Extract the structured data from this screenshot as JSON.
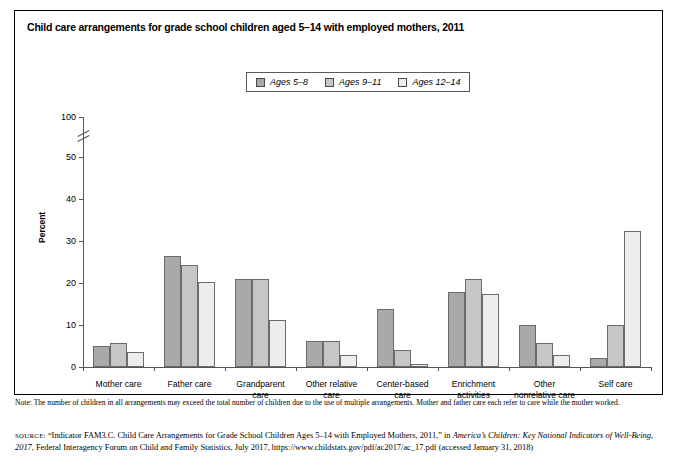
{
  "figure": {
    "title": "Child care arrangements for grade school children aged 5–14 with employed mothers, 2011"
  },
  "legend": {
    "items": [
      {
        "label": "Ages 5–8",
        "color": "#a9a9a9"
      },
      {
        "label": "Ages 9–11",
        "color": "#c6c6c6"
      },
      {
        "label": "Ages 12–14",
        "color": "#eeeeee"
      }
    ]
  },
  "chart_data": {
    "type": "bar",
    "title": "Child care arrangements for grade school children aged 5–14 with employed mothers, 2011",
    "xlabel": "",
    "ylabel": "Percent",
    "ylim": [
      0,
      100
    ],
    "yticks": [
      0,
      10,
      20,
      30,
      40,
      50,
      100
    ],
    "axis_break": "between 50 and 100",
    "grid": false,
    "legend_position": "top-center",
    "categories": [
      "Mother care",
      "Father care",
      "Grandparent care",
      "Other relative care",
      "Center-based care",
      "Enrichment activities",
      "Other nonrelative care",
      "Self care"
    ],
    "series": [
      {
        "name": "Ages 5–8",
        "color": "#a9a9a9",
        "values": [
          4.9,
          26.5,
          21.0,
          6.2,
          13.8,
          17.9,
          10.0,
          2.2
        ]
      },
      {
        "name": "Ages 9–11",
        "color": "#c6c6c6",
        "values": [
          5.6,
          24.3,
          21.0,
          6.2,
          4.0,
          21.0,
          5.8,
          10.0
        ]
      },
      {
        "name": "Ages 12–14",
        "color": "#eeeeee",
        "values": [
          3.5,
          20.3,
          11.3,
          2.8,
          0.7,
          17.5,
          2.9,
          32.5
        ]
      }
    ]
  },
  "axis": {
    "y_label": "Percent",
    "y_ticks": [
      "100",
      "50",
      "40",
      "30",
      "20",
      "10",
      "0"
    ]
  },
  "categories": [
    {
      "line1": "Mother care",
      "line2": ""
    },
    {
      "line1": "Father care",
      "line2": ""
    },
    {
      "line1": "Grandparent",
      "line2": "care"
    },
    {
      "line1": "Other relative",
      "line2": "care"
    },
    {
      "line1": "Center-based",
      "line2": "care"
    },
    {
      "line1": "Enrichment",
      "line2": "activities"
    },
    {
      "line1": "Other",
      "line2": "nonrelative care"
    },
    {
      "line1": "Self care",
      "line2": ""
    }
  ],
  "footer": {
    "note": "Note: The number of children in all arrangements may exceed the total number of children due to the use of multiple arrangements. Mother and father care each refer to care while the mother worked.",
    "source_prefix": "SOURCE:",
    "source_part1": " “Indicator FAM3.C. Child Care Arrangements for Grade School Children Ages 5–14 with Employed Mothers, 2011,” in ",
    "source_italic1": "America’s Children: Key National Indicators of Well-Being, 2017",
    "source_part2": ", Federal Interagency Forum on Child and Family Statistics, July 2017, https://www.childstats.gov/pdf/ac2017/ac_17.pdf (accessed January 31, 2018)"
  }
}
